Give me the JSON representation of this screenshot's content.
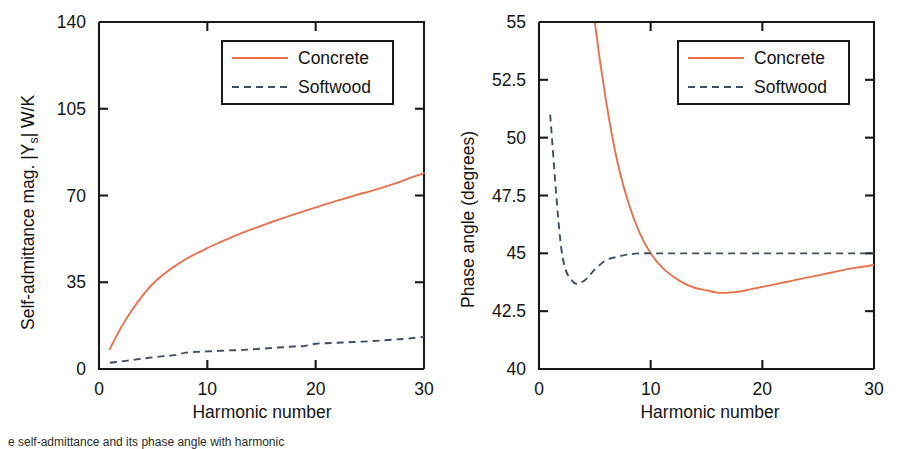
{
  "figure": {
    "panel_count": 2,
    "background_color": "#ffffff",
    "caption_partial": "e self-admittance and its phase angle with harmonic"
  },
  "colors": {
    "concrete": "#e8714f",
    "softwood": "#3f4f63",
    "axis": "#1a1a1a",
    "text": "#141414",
    "background": "#ffffff"
  },
  "legend": {
    "entries": [
      {
        "label": "Concrete",
        "style": "solid",
        "color": "#e8714f"
      },
      {
        "label": "Softwood",
        "style": "dashed",
        "color": "#3f4f63"
      }
    ]
  },
  "chart_data": [
    {
      "id": "self-admittance-magnitude",
      "type": "line",
      "title": "",
      "xlabel": "Harmonic number",
      "ylabel": "Self-admittance mag. |Y",
      "ylabel_sub": "s",
      "ylabel_tail": "| W/K",
      "ylabel_full": "Self-admittance mag. |Ys| W/K",
      "xlim": [
        0,
        30
      ],
      "ylim": [
        0,
        140
      ],
      "xticks": [
        0,
        10,
        20,
        30
      ],
      "xticklabels": [
        "0",
        "10",
        "20",
        "30"
      ],
      "yticks": [
        0,
        35,
        70,
        105,
        140
      ],
      "yticklabels": [
        "0",
        "35",
        "70",
        "105",
        "140"
      ],
      "grid": false,
      "legend_position": "upper center",
      "x": [
        1,
        2,
        3,
        4,
        5,
        6,
        7,
        8,
        9,
        10,
        11,
        12,
        13,
        14,
        15,
        16,
        17,
        18,
        19,
        20,
        21,
        22,
        23,
        24,
        25,
        26,
        27,
        28,
        29,
        30
      ],
      "series": [
        {
          "name": "Concrete",
          "color": "#e8714f",
          "style": "solid",
          "values": [
            8.0,
            16.5,
            23.5,
            29.5,
            34.5,
            38.3,
            41.5,
            44.3,
            46.6,
            48.8,
            50.8,
            52.7,
            54.5,
            56.2,
            57.8,
            59.4,
            60.9,
            62.4,
            63.8,
            65.2,
            66.6,
            67.9,
            69.2,
            70.5,
            71.7,
            73.0,
            74.4,
            75.9,
            77.5,
            79.0
          ]
        },
        {
          "name": "Softwood",
          "color": "#3f4f63",
          "style": "dashed",
          "values": [
            2.5,
            3.0,
            3.6,
            4.2,
            4.7,
            5.2,
            5.6,
            6.6,
            6.9,
            7.1,
            7.3,
            7.5,
            7.6,
            7.9,
            8.2,
            8.5,
            8.8,
            9.1,
            9.3,
            10.2,
            10.4,
            10.6,
            10.8,
            11.0,
            11.2,
            11.5,
            11.8,
            12.1,
            12.5,
            13.0
          ]
        }
      ]
    },
    {
      "id": "phase-angle",
      "type": "line",
      "title": "",
      "xlabel": "Harmonic number",
      "ylabel": "Phase angle (degrees)",
      "xlim": [
        0,
        30
      ],
      "ylim": [
        40,
        55
      ],
      "xticks": [
        0,
        10,
        20,
        30
      ],
      "xticklabels": [
        "0",
        "10",
        "20",
        "30"
      ],
      "yticks": [
        40,
        42.5,
        45,
        47.5,
        50,
        52.5,
        55
      ],
      "yticklabels": [
        "40",
        "42.5",
        "45",
        "47.5",
        "50",
        "52.5",
        "55"
      ],
      "grid": false,
      "legend_position": "upper center",
      "x": [
        1,
        2,
        3,
        4,
        5,
        6,
        7,
        8,
        9,
        10,
        11,
        12,
        13,
        14,
        15,
        16,
        17,
        18,
        19,
        20,
        21,
        22,
        23,
        24,
        25,
        26,
        27,
        28,
        29,
        30
      ],
      "series": [
        {
          "name": "Concrete",
          "color": "#e8714f",
          "style": "solid",
          "note": "values above 55 are clipped off the top of the axis",
          "values": [
            78.0,
            70.0,
            64.0,
            59.5,
            55.0,
            51.6,
            49.0,
            47.2,
            45.9,
            45.0,
            44.4,
            44.0,
            43.7,
            43.5,
            43.4,
            43.3,
            43.3,
            43.35,
            43.45,
            43.55,
            43.65,
            43.75,
            43.85,
            43.95,
            44.05,
            44.15,
            44.25,
            44.35,
            44.42,
            44.5
          ]
        },
        {
          "name": "Softwood",
          "color": "#3f4f63",
          "style": "dashed",
          "values": [
            51.0,
            45.2,
            43.8,
            43.8,
            44.3,
            44.7,
            44.85,
            44.95,
            45.0,
            45.0,
            45.0,
            45.0,
            45.0,
            45.0,
            45.0,
            45.0,
            45.0,
            45.0,
            45.0,
            45.0,
            45.0,
            45.0,
            45.0,
            45.0,
            45.0,
            45.0,
            45.0,
            45.0,
            45.0,
            45.0
          ]
        }
      ]
    }
  ]
}
